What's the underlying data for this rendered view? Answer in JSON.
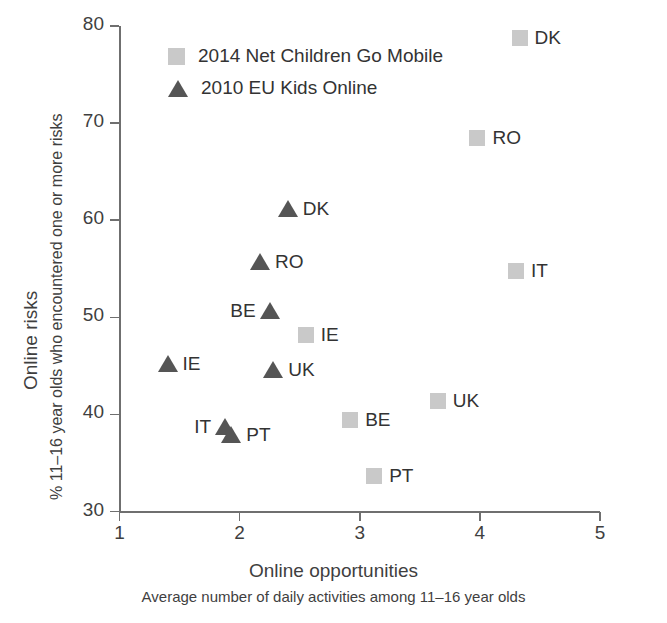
{
  "chart_data": {
    "type": "scatter",
    "title": "",
    "xlabel": "Online opportunities",
    "xsublabel": "Average number of daily activities among 11–16 year olds",
    "ylabel": "Online risks",
    "ysublabel": "% 11–16 year olds who encountered one or more risks",
    "xlim": [
      1,
      5
    ],
    "ylim": [
      30,
      80
    ],
    "xticks": [
      "1",
      "2",
      "3",
      "4",
      "5"
    ],
    "yticks": [
      "80",
      "70",
      "60",
      "50",
      "40",
      "30"
    ],
    "grid": false,
    "legend_position": "top-left",
    "colors": {
      "series_2014": "#c9c9c9",
      "series_2010": "#555555",
      "axis": "#6f6f6f",
      "text": "#333333"
    },
    "series": [
      {
        "name": "2014 Net Children Go Mobile",
        "marker": "square",
        "color": "#c9c9c9",
        "points": [
          {
            "label": "DK",
            "x": 4.33,
            "y": 78.8,
            "label_side": "right"
          },
          {
            "label": "RO",
            "x": 3.98,
            "y": 68.5,
            "label_side": "right"
          },
          {
            "label": "IT",
            "x": 4.3,
            "y": 54.8,
            "label_side": "right"
          },
          {
            "label": "IE",
            "x": 2.55,
            "y": 48.2,
            "label_side": "right"
          },
          {
            "label": "UK",
            "x": 3.65,
            "y": 41.4,
            "label_side": "right"
          },
          {
            "label": "BE",
            "x": 2.92,
            "y": 39.4,
            "label_side": "right"
          },
          {
            "label": "PT",
            "x": 3.12,
            "y": 33.7,
            "label_side": "right"
          }
        ]
      },
      {
        "name": "2010 EU Kids Online",
        "marker": "triangle",
        "color": "#555555",
        "points": [
          {
            "label": "DK",
            "x": 2.4,
            "y": 61.2,
            "label_side": "right"
          },
          {
            "label": "RO",
            "x": 2.17,
            "y": 55.7,
            "label_side": "right"
          },
          {
            "label": "BE",
            "x": 2.25,
            "y": 50.6,
            "label_side": "left"
          },
          {
            "label": "UK",
            "x": 2.28,
            "y": 44.6,
            "label_side": "right"
          },
          {
            "label": "IE",
            "x": 1.4,
            "y": 45.2,
            "label_side": "right"
          },
          {
            "label": "IT",
            "x": 1.88,
            "y": 38.7,
            "label_side": "left"
          },
          {
            "label": "PT",
            "x": 1.93,
            "y": 37.9,
            "label_side": "right"
          }
        ]
      }
    ]
  },
  "legend": {
    "items": [
      {
        "label": "2014 Net Children Go Mobile",
        "marker": "square"
      },
      {
        "label": "2010 EU Kids Online",
        "marker": "triangle"
      }
    ]
  },
  "axes": {
    "y_title": "Online risks",
    "y_subtitle": "% 11–16 year olds who encountered one or more risks",
    "x_title": "Online opportunities",
    "x_subtitle": "Average number of daily activities among 11–16 year olds"
  }
}
